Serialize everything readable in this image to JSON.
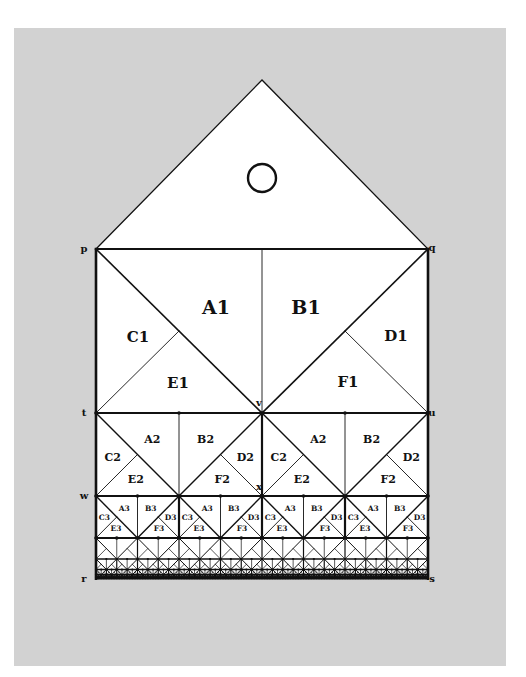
{
  "figure": {
    "background_color": "#d2d2d2",
    "line_color": "#111111",
    "fill_color": "#ffffff",
    "roof": {
      "apex": [
        262,
        80
      ],
      "circle": {
        "cx": 262,
        "cy": 178,
        "r": 14
      }
    },
    "square": {
      "x0": 96,
      "x1": 428,
      "y_top": 249,
      "y_rows": [
        249,
        413,
        496,
        538,
        559,
        569.5,
        574.7,
        577.3,
        578.6
      ]
    },
    "points": [
      {
        "name": "p",
        "x": 84,
        "y": 252
      },
      {
        "name": "q",
        "x": 432,
        "y": 251
      },
      {
        "name": "t",
        "x": 84,
        "y": 416
      },
      {
        "name": "u",
        "x": 432,
        "y": 416
      },
      {
        "name": "v",
        "x": 259,
        "y": 406
      },
      {
        "name": "w",
        "x": 84,
        "y": 499
      },
      {
        "name": "x",
        "x": 259,
        "y": 490
      },
      {
        "name": "r",
        "x": 84,
        "y": 582
      },
      {
        "name": "s",
        "x": 432,
        "y": 582
      }
    ],
    "row1_labels": [
      {
        "text": "A1",
        "x": 216,
        "y": 314,
        "size": 19
      },
      {
        "text": "B1",
        "x": 306,
        "y": 314,
        "size": 19
      },
      {
        "text": "C1",
        "x": 138,
        "y": 342,
        "size": 15
      },
      {
        "text": "D1",
        "x": 396,
        "y": 341,
        "size": 15
      },
      {
        "text": "E1",
        "x": 178,
        "y": 388,
        "size": 15
      },
      {
        "text": "F1",
        "x": 348,
        "y": 387,
        "size": 15
      }
    ],
    "row2_labels": [
      "A2",
      "B2",
      "C2",
      "D2",
      "E2",
      "F2"
    ],
    "row3_labels": [
      "A3",
      "B3",
      "C3",
      "D3",
      "E3",
      "F3"
    ]
  }
}
